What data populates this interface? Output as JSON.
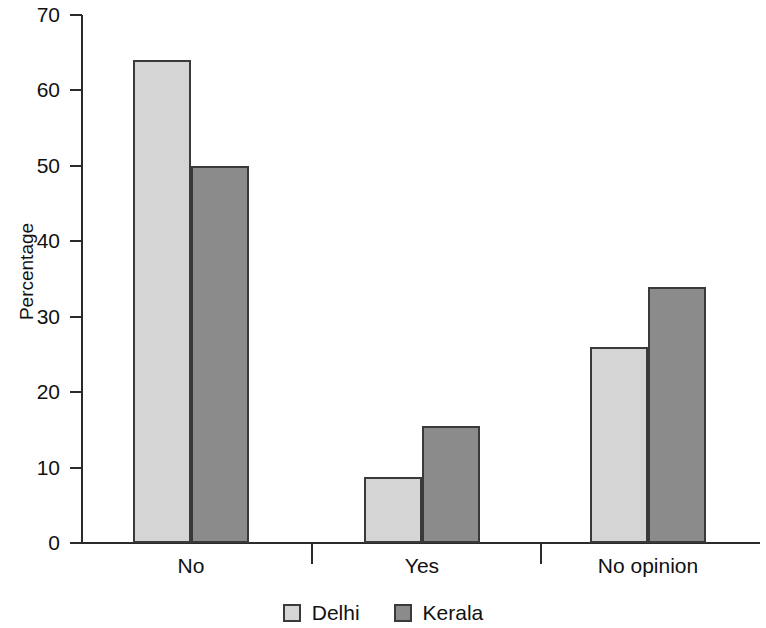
{
  "chart_data": {
    "type": "bar",
    "title": "",
    "xlabel": "",
    "ylabel": "Percentage",
    "categories": [
      "No",
      "Yes",
      "No opinion"
    ],
    "series": [
      {
        "name": "Delhi",
        "color": "#d5d5d5",
        "values": [
          64,
          8.7,
          26
        ]
      },
      {
        "name": "Kerala",
        "color": "#8b8b8b",
        "values": [
          50,
          15.5,
          34
        ]
      }
    ],
    "ylim": [
      0,
      70
    ],
    "ytick_labels": [
      "0",
      "10",
      "20",
      "30",
      "40",
      "50",
      "60",
      "70"
    ],
    "ytick_values": [
      0,
      10,
      20,
      30,
      40,
      50,
      60,
      70
    ],
    "grid": false,
    "legend_position": "bottom"
  },
  "legend": {
    "items": [
      {
        "label": "Delhi",
        "color": "#d5d5d5"
      },
      {
        "label": "Kerala",
        "color": "#8b8b8b"
      }
    ]
  },
  "axis": {
    "y_title": "Percentage"
  }
}
